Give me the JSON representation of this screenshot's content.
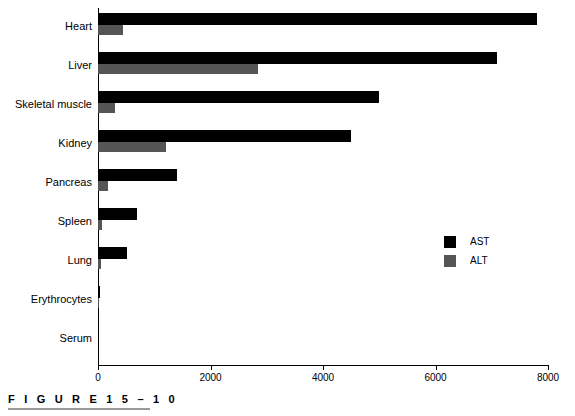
{
  "figure": {
    "caption": "F I G U R E   1 5 – 1 0",
    "caption_plain": "FIGURE 15-10"
  },
  "legend": {
    "position": "inside-right",
    "entries": [
      {
        "label": "AST",
        "color": "#000000",
        "swatch": "ast-swatch"
      },
      {
        "label": "ALT",
        "color": "#555555",
        "swatch": "alt-swatch"
      }
    ]
  },
  "axis": {
    "x_ticks": [
      "0",
      "2000",
      "4000",
      "6000",
      "8000"
    ],
    "x_min": 0,
    "x_max": 8000
  },
  "chart_data": {
    "type": "bar",
    "orientation": "horizontal",
    "title": "",
    "xlabel": "",
    "ylabel": "",
    "xlim": [
      0,
      8000
    ],
    "grid": false,
    "legend_position": "inside-right",
    "categories": [
      "Heart",
      "Liver",
      "Skeletal muscle",
      "Kidney",
      "Pancreas",
      "Spleen",
      "Lung",
      "Erythrocytes",
      "Serum"
    ],
    "series": [
      {
        "name": "AST",
        "color": "#000000",
        "values": [
          7800,
          7100,
          5000,
          4500,
          1400,
          700,
          520,
          40,
          0
        ]
      },
      {
        "name": "ALT",
        "color": "#555555",
        "values": [
          450,
          2850,
          300,
          1200,
          180,
          70,
          45,
          10,
          0
        ]
      }
    ]
  }
}
